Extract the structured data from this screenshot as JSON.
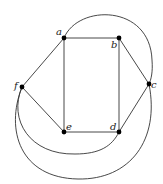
{
  "diagram": {
    "type": "graph",
    "nodes": [
      {
        "id": "a",
        "label": "a",
        "x": 64,
        "y": 38,
        "lx": 56,
        "ly": 35
      },
      {
        "id": "b",
        "label": "b",
        "x": 119,
        "y": 38,
        "lx": 111,
        "ly": 48
      },
      {
        "id": "c",
        "label": "c",
        "x": 149,
        "y": 84,
        "lx": 151,
        "ly": 88
      },
      {
        "id": "d",
        "label": "d",
        "x": 119,
        "y": 132,
        "lx": 110,
        "ly": 130
      },
      {
        "id": "e",
        "label": "e",
        "x": 64,
        "y": 132,
        "lx": 66,
        "ly": 130
      },
      {
        "id": "f",
        "label": "f",
        "x": 22,
        "y": 87,
        "lx": 14,
        "ly": 89
      }
    ],
    "edges": [
      {
        "from": "a",
        "to": "b",
        "kind": "straight"
      },
      {
        "from": "b",
        "to": "c",
        "kind": "straight"
      },
      {
        "from": "c",
        "to": "d",
        "kind": "straight"
      },
      {
        "from": "d",
        "to": "e",
        "kind": "straight"
      },
      {
        "from": "e",
        "to": "f",
        "kind": "straight"
      },
      {
        "from": "f",
        "to": "a",
        "kind": "straight"
      },
      {
        "from": "a",
        "to": "e",
        "kind": "straight"
      },
      {
        "from": "b",
        "to": "d",
        "kind": "straight"
      },
      {
        "from": "a",
        "to": "c",
        "kind": "curve",
        "path": "M64,38 C78,4 150,4 152,60 C153,72 151,80 149,84"
      },
      {
        "from": "f",
        "to": "d",
        "kind": "curve",
        "path": "M22,87 C8,120 30,155 75,154 C100,154 112,146 119,132"
      },
      {
        "from": "f",
        "to": "c",
        "kind": "curve",
        "path": "M22,87 C5,130 20,178 78,179 C130,180 160,140 149,84"
      }
    ]
  }
}
